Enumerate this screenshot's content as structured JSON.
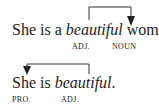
{
  "examples": [
    {
      "sentence": {
        "before": "She is a ",
        "emphasis": "beautiful",
        "after": " woman."
      },
      "labels": [
        {
          "text": "ADJ."
        },
        {
          "text": "NOUN"
        }
      ],
      "arrow": {
        "from": "beautiful",
        "to": "woman",
        "direction": "right"
      }
    },
    {
      "sentence": {
        "before": "She is ",
        "emphasis": "beautiful",
        "after": "."
      },
      "labels": [
        {
          "text": "PRO."
        },
        {
          "text": "ADJ."
        }
      ],
      "arrow": {
        "from": "beautiful",
        "to": "She",
        "direction": "left"
      }
    }
  ],
  "colors": {
    "text": "#222222",
    "arrow": "#333333",
    "background": "#ffffff"
  }
}
